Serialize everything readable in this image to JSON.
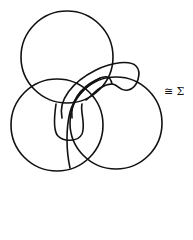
{
  "figure": {
    "components": [
      {
        "name": "top-circle",
        "cx": 67,
        "cy": 57,
        "r": 46
      },
      {
        "name": "left-circle",
        "cx": 57,
        "cy": 125,
        "r": 46
      },
      {
        "name": "right-circle",
        "cx": 116,
        "cy": 123,
        "r": 46
      },
      {
        "name": "band-loop",
        "kind": "closed tube/band curve"
      }
    ],
    "stroke_color": "#111111",
    "background": "#ffffff"
  },
  "label": {
    "text": "≅ Σ"
  }
}
